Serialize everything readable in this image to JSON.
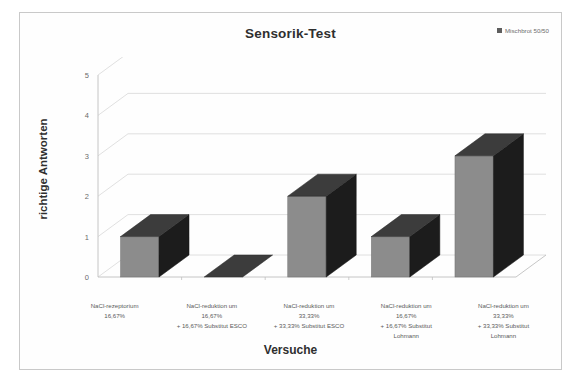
{
  "chart_data": {
    "type": "bar",
    "title": "Sensorik-Test",
    "xlabel": "Versuche",
    "ylabel": "richtige Antworten",
    "ylim": [
      0,
      5
    ],
    "yticks": [
      0,
      1,
      2,
      3,
      4,
      5
    ],
    "grid": true,
    "legend_position": "top-right",
    "three_d": true,
    "categories": [
      "NaCl-rezeptorium\n16,67%",
      "NaCl-reduktion um\n16,67%\n+ 16,67% Substitut ESCO",
      "NaCl-reduktion um\n33,33%\n+ 33,33% Substitut ESCO",
      "NaCl-reduktion um\n16,67%\n+ 16,67% Substitut\nLohmann",
      "NaCl-reduktion um\n33,33%\n+ 33,33% Substitut\nLohmann"
    ],
    "category_lines": [
      [
        "NaCl-rezeptorium",
        "16,67%"
      ],
      [
        "NaCl-reduktion um",
        "16,67%",
        "+ 16,67% Substitut ESCO"
      ],
      [
        "NaCl-reduktion um",
        "33,33%",
        "+ 33,33% Substitut ESCO"
      ],
      [
        "NaCl-reduktion um",
        "16,67%",
        "+ 16,67% Substitut",
        "Lohmann"
      ],
      [
        "NaCl-reduktion um",
        "33,33%",
        "+ 33,33% Substitut",
        "Lohmann"
      ]
    ],
    "series": [
      {
        "name": "Mischbrot 50/50",
        "values": [
          1,
          0,
          2,
          1,
          3
        ],
        "color": "#8c8c8c",
        "top_color": "#3c3c3c",
        "side_color": "#1c1c1c"
      }
    ]
  },
  "legend": {
    "entries": [
      {
        "label": "Mischbrot 50/50",
        "color": "#3b3b3b"
      }
    ]
  },
  "colors": {
    "bar_front": "#8c8c8c",
    "bar_top": "#3c3c3c",
    "bar_side": "#1c1c1c",
    "grid": "#d8d8d8",
    "axis": "#c0c0c0",
    "frame": "#c9c9c9",
    "text": "#3a3a3a"
  }
}
